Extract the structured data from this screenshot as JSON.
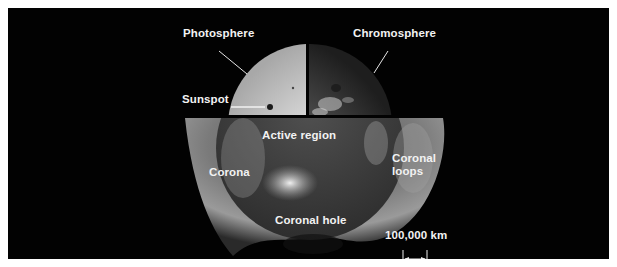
{
  "figure": {
    "labels": {
      "photosphere": "Photosphere",
      "chromosphere": "Chromosphere",
      "sunspot": "Sunspot",
      "active_region": "Active region",
      "corona": "Corona",
      "coronal_loops": "Coronal loops",
      "coronal_hole": "Coronal hole"
    },
    "scale_bar": {
      "label": "100,000 km"
    },
    "colors": {
      "background": "#020202",
      "page": "#ffffff",
      "label_text": "#f2f2f2",
      "photosphere": "#d9d9d9",
      "chromosphere": "#5a5a5a",
      "corona": "#8c8c8c"
    }
  }
}
